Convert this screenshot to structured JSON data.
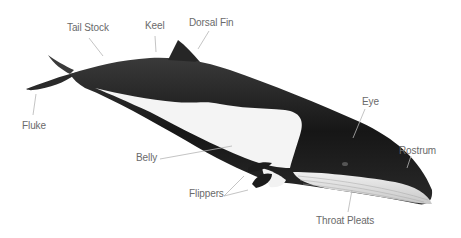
{
  "diagram": {
    "labels": [
      {
        "id": "tail-stock",
        "text": "Tail Stock",
        "x": 67,
        "y": 22
      },
      {
        "id": "keel",
        "text": "Keel",
        "x": 145,
        "y": 20
      },
      {
        "id": "dorsal-fin",
        "text": "Dorsal Fin",
        "x": 189,
        "y": 17
      },
      {
        "id": "eye",
        "text": "Eye",
        "x": 362,
        "y": 96
      },
      {
        "id": "rostrum",
        "text": "Rostrum",
        "x": 399,
        "y": 145
      },
      {
        "id": "fluke",
        "text": "Fluke",
        "x": 22,
        "y": 120
      },
      {
        "id": "belly",
        "text": "Belly",
        "x": 136,
        "y": 152
      },
      {
        "id": "flippers",
        "text": "Flippers",
        "x": 189,
        "y": 188
      },
      {
        "id": "throat-pleats",
        "text": "Throat Pleats",
        "x": 316,
        "y": 215
      }
    ],
    "colors": {
      "body_dark": "#1e1e1e",
      "belly_light": "#f4f4f4",
      "pleats": "#d8d8d8",
      "leader_line": "#b5b5b5",
      "label_text": "#6a6a6a"
    }
  }
}
